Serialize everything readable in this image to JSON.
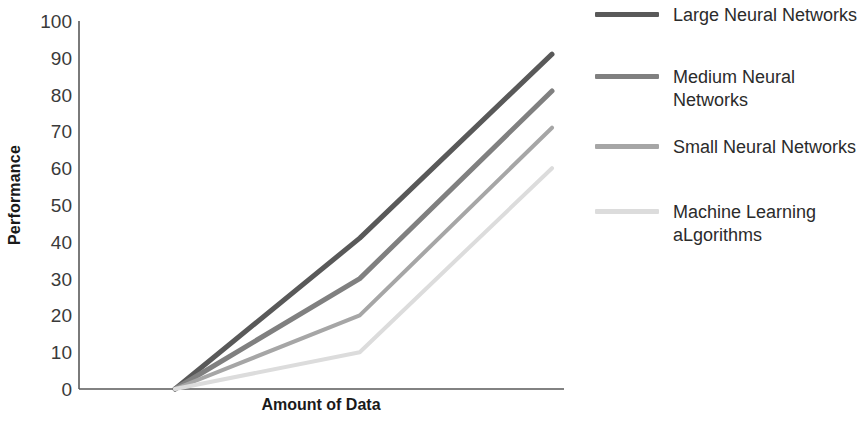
{
  "chart_data": {
    "type": "line",
    "title": "",
    "xlabel": "Amount of Data",
    "ylabel": "Performance",
    "ylim": [
      0,
      100
    ],
    "yticks": [
      0,
      10,
      20,
      30,
      40,
      50,
      60,
      70,
      80,
      90,
      100
    ],
    "xticks": [],
    "xtick_labels": [],
    "grid": false,
    "legend_position": "right",
    "x": [
      0,
      0.49,
      1
    ],
    "series": [
      {
        "name": "Large Neural Networks",
        "values": [
          0,
          41,
          91
        ],
        "color": "#595959",
        "width": 5
      },
      {
        "name": "Medium Neural Networks",
        "values": [
          0,
          30,
          81
        ],
        "color": "#808080",
        "width": 5
      },
      {
        "name": "Small Neural Networks",
        "values": [
          0,
          20,
          71
        ],
        "color": "#a6a6a6",
        "width": 4
      },
      {
        "name": "Machine Learning aLgorithms",
        "values": [
          0,
          10,
          60
        ],
        "color": "#dcdcdc",
        "width": 4
      }
    ]
  },
  "axes": {
    "y_title": "Performance",
    "x_title": "Amount of Data",
    "y_tick_labels": [
      "100",
      "90",
      "80",
      "70",
      "60",
      "50",
      "40",
      "30",
      "20",
      "10",
      "0"
    ],
    "axis_color": "#595959"
  },
  "legend": {
    "items": [
      {
        "label": "Large Neural Networks",
        "color": "#595959"
      },
      {
        "label": "Medium Neural Networks",
        "color": "#808080"
      },
      {
        "label": "Small Neural Networks",
        "color": "#a6a6a6"
      },
      {
        "label": "Machine Learning aLgorithms",
        "color": "#dcdcdc"
      }
    ]
  }
}
